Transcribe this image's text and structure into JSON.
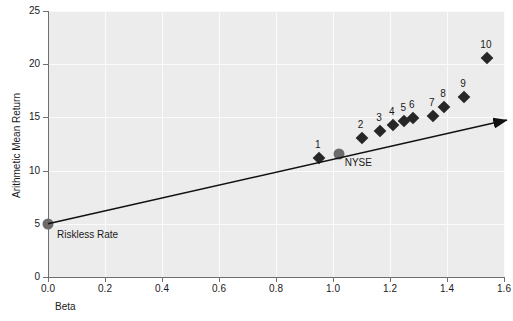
{
  "chart_data": {
    "type": "scatter",
    "title": "",
    "xlabel": "Beta",
    "ylabel": "Arithmetic Mean Return",
    "xlim": [
      0.0,
      1.6
    ],
    "ylim": [
      0,
      25
    ],
    "xticks": [
      "0.0",
      "0.2",
      "0.4",
      "0.6",
      "0.8",
      "1.0",
      "1.2",
      "1.4",
      "1.6"
    ],
    "xtick_values": [
      0.0,
      0.2,
      0.4,
      0.6,
      0.8,
      1.0,
      1.2,
      1.4,
      1.6
    ],
    "yticks": [
      "0",
      "5",
      "10",
      "15",
      "20",
      "25"
    ],
    "ytick_values": [
      0,
      5,
      10,
      15,
      20,
      25
    ],
    "grid": true,
    "grid_color": "#fbfbfb",
    "plot_background": "#ececec",
    "legend": "none",
    "marker_color": "#262626",
    "highlight_color": "#6b6b6b",
    "line": {
      "name": "Security Market Line",
      "style": "solid-with-arrowhead",
      "color": "#111111",
      "from": {
        "x": 0.0,
        "y": 5.0
      },
      "to": {
        "x": 1.61,
        "y": 14.75
      }
    },
    "points": [
      {
        "label": "1",
        "x": 0.95,
        "y": 11.2,
        "marker": "diamond"
      },
      {
        "label": "2",
        "x": 1.1,
        "y": 13.1,
        "marker": "diamond"
      },
      {
        "label": "3",
        "x": 1.165,
        "y": 13.7,
        "marker": "diamond"
      },
      {
        "label": "4",
        "x": 1.21,
        "y": 14.3,
        "marker": "diamond"
      },
      {
        "label": "5",
        "x": 1.25,
        "y": 14.7,
        "marker": "diamond"
      },
      {
        "label": "6",
        "x": 1.28,
        "y": 14.9,
        "marker": "diamond"
      },
      {
        "label": "7",
        "x": 1.35,
        "y": 15.1,
        "marker": "diamond"
      },
      {
        "label": "8",
        "x": 1.39,
        "y": 16.0,
        "marker": "diamond"
      },
      {
        "label": "9",
        "x": 1.46,
        "y": 16.9,
        "marker": "diamond"
      },
      {
        "label": "10",
        "x": 1.54,
        "y": 20.6,
        "marker": "diamond"
      }
    ],
    "annotated_points": [
      {
        "label": "Riskless Rate",
        "x": 0.0,
        "y": 5.0,
        "marker": "circle",
        "label_dx": 9,
        "label_dy": 16
      },
      {
        "label": "NYSE",
        "x": 1.02,
        "y": 11.55,
        "marker": "circle",
        "label_dx": 6,
        "label_dy": 14
      }
    ]
  }
}
